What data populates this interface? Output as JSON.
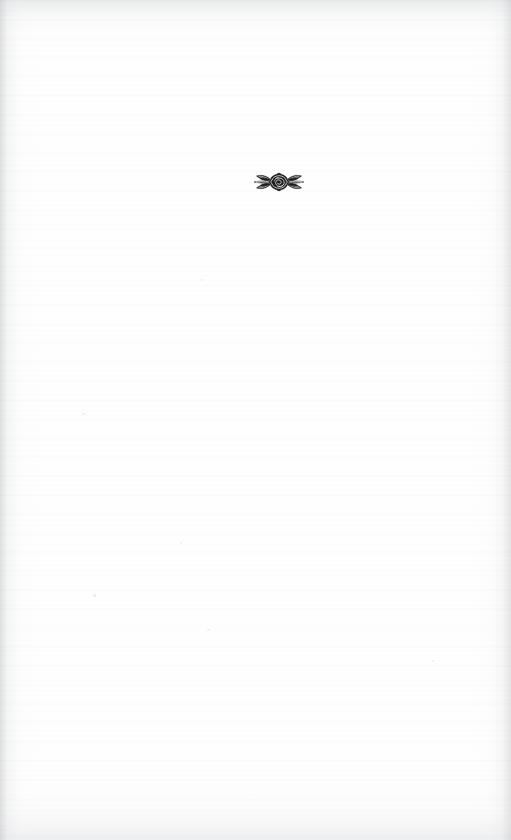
{
  "document": {
    "type": "scanned-book-page",
    "page_kind": "blank-page-with-ornament",
    "background_color": "#fefefe",
    "ink_color": "#1c1c1c",
    "width": 511,
    "height": 840,
    "body_text": "",
    "page_number": "",
    "header_text": "",
    "footer_text": ""
  },
  "ornament": {
    "name": "floral-rosette-ornament",
    "description": "Horizontal printer's floral device: a central rose flanked by symmetrical pointed leaves",
    "label": "",
    "color": "#1c1c1c",
    "center_x": 278,
    "center_y": 182,
    "width": 54,
    "height": 24
  },
  "scan": {
    "left_edge_shadow": "#c4c6c8",
    "right_edge_shadow": "#c9cbcd",
    "top_edge_shadow": "#d6d8da",
    "bottom_edge_shadow": "#dbddde",
    "speck_color": "#ededf0"
  }
}
